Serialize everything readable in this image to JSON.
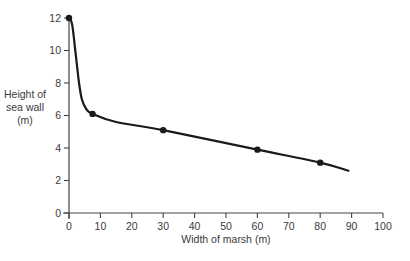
{
  "chart_data": {
    "type": "line",
    "title": "",
    "xlabel": "Width of marsh (m)",
    "ylabel": "Height of sea wall (m)",
    "ylabel_lines": [
      "Height of",
      "sea wall",
      "(m)"
    ],
    "xlim": [
      0,
      100
    ],
    "ylim": [
      0,
      12
    ],
    "x_ticks": [
      0,
      10,
      20,
      30,
      40,
      50,
      60,
      70,
      80,
      90,
      100
    ],
    "y_ticks": [
      0,
      2,
      4,
      6,
      8,
      10,
      12
    ],
    "grid": false,
    "legend": null,
    "series": [
      {
        "name": "Height of sea wall",
        "markers": [
          {
            "x": 0,
            "y": 12
          },
          {
            "x": 7.5,
            "y": 6.1
          },
          {
            "x": 30,
            "y": 5.1
          },
          {
            "x": 60,
            "y": 3.9
          },
          {
            "x": 80,
            "y": 3.1
          }
        ],
        "curve": [
          {
            "x": 0,
            "y": 12
          },
          {
            "x": 1,
            "y": 11.6
          },
          {
            "x": 2,
            "y": 10
          },
          {
            "x": 3.2,
            "y": 8
          },
          {
            "x": 4.1,
            "y": 7
          },
          {
            "x": 5.5,
            "y": 6.4
          },
          {
            "x": 7.5,
            "y": 6.1
          },
          {
            "x": 15,
            "y": 5.6
          },
          {
            "x": 30,
            "y": 5.1
          },
          {
            "x": 60,
            "y": 3.9
          },
          {
            "x": 80,
            "y": 3.1
          },
          {
            "x": 89,
            "y": 2.6
          }
        ]
      }
    ]
  },
  "style": {
    "axis_color": "#444444",
    "line_color": "#1a1a1a",
    "text_color": "#3a3a3a"
  }
}
